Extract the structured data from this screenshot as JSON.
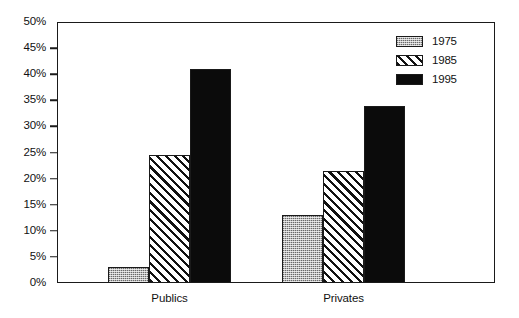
{
  "chart_data": {
    "type": "bar",
    "title": "",
    "subtitle": "",
    "xlabel": "",
    "ylabel": "",
    "categories": [
      "Publics",
      "Privates"
    ],
    "series": [
      {
        "name": "1975",
        "values": [
          3,
          13
        ],
        "fill": "stipple-grey",
        "color": "#b9b9b9"
      },
      {
        "name": "1985",
        "values": [
          24.5,
          21.5
        ],
        "fill": "diagonal-hatch",
        "color": "#ffffff"
      },
      {
        "name": "1995",
        "values": [
          41,
          34
        ],
        "fill": "solid-black",
        "color": "#0b0b0b"
      }
    ],
    "ylim": [
      0,
      50
    ],
    "ytick_values": [
      0,
      5,
      10,
      15,
      20,
      25,
      30,
      35,
      40,
      45,
      50
    ],
    "ytick_labels": [
      "0%",
      "5%",
      "10%",
      "15%",
      "20%",
      "25%",
      "30%",
      "35%",
      "40%",
      "45%",
      "50%"
    ],
    "value_format": "percent",
    "grid": false,
    "legend_position": "top-right",
    "frame": true,
    "annotations": []
  },
  "legend": {
    "entries": [
      {
        "label": "1975"
      },
      {
        "label": "1985"
      },
      {
        "label": "1995"
      }
    ]
  }
}
